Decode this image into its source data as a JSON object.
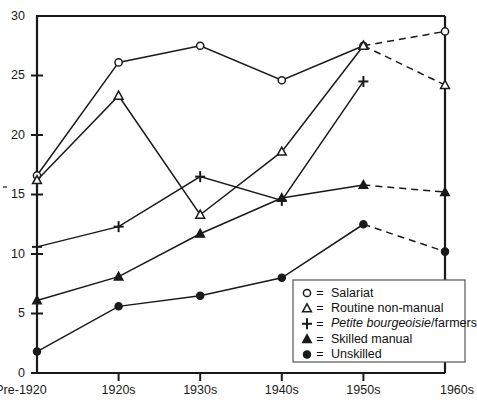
{
  "chart_data": {
    "type": "line",
    "title": "",
    "xlabel": "",
    "ylabel": "",
    "categories": [
      "Pre-1920",
      "1920s",
      "1930s",
      "1940s",
      "1950s",
      "1960s"
    ],
    "ylim": [
      0,
      30
    ],
    "yticks": [
      0,
      5,
      10,
      15,
      20,
      25,
      30
    ],
    "grid": false,
    "legend_position": "bottom-right",
    "note": "Solid line segments connect Pre-1920 through 1950s; segments from 1950s to 1960s are dashed.",
    "series": [
      {
        "name": "Salariat",
        "marker": "open-circle",
        "values": [
          16.6,
          26.1,
          27.5,
          24.6,
          27.5,
          28.7
        ]
      },
      {
        "name": "Routine non-manual",
        "marker": "open-triangle",
        "values": [
          16.2,
          23.3,
          13.3,
          18.6,
          27.5,
          24.2
        ]
      },
      {
        "name": "Petite bourgeoisie/farmers",
        "marker": "plus",
        "values": [
          10.6,
          12.3,
          16.5,
          14.5,
          24.5,
          null
        ]
      },
      {
        "name": "Skilled manual",
        "marker": "filled-triangle",
        "values": [
          6.1,
          8.1,
          11.7,
          14.7,
          15.8,
          15.2
        ]
      },
      {
        "name": "Unskilled",
        "marker": "filled-circle",
        "values": [
          1.8,
          5.6,
          6.5,
          8.0,
          12.5,
          10.2
        ]
      }
    ]
  },
  "legend": {
    "separator": "=",
    "entries": [
      {
        "marker": "open-circle",
        "label": "Salariat",
        "italic_part": "",
        "plain_part": "Salariat"
      },
      {
        "marker": "open-triangle",
        "label": "Routine non-manual",
        "italic_part": "",
        "plain_part": "Routine non-manual"
      },
      {
        "marker": "plus",
        "label": "Petite bourgeoisie/farmers",
        "italic_part": "Petite bourgeoisie",
        "plain_part": "/farmers"
      },
      {
        "marker": "filled-triangle",
        "label": "Skilled manual",
        "italic_part": "",
        "plain_part": "Skilled manual"
      },
      {
        "marker": "filled-circle",
        "label": "Unskilled",
        "italic_part": "",
        "plain_part": "Unskilled"
      }
    ]
  },
  "colors": {
    "ink": "#1a1a1a",
    "background": "#ffffff",
    "legend_border": "#555555"
  }
}
